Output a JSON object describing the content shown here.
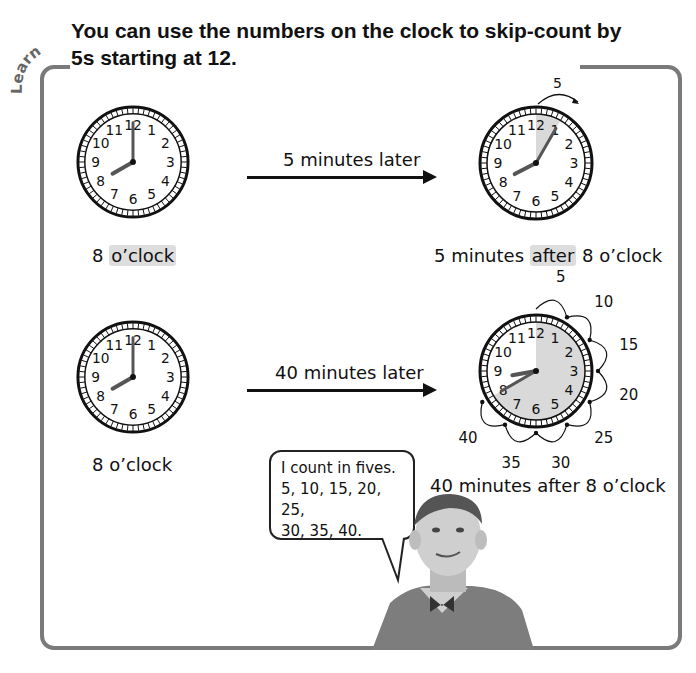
{
  "section_tag": "Learn",
  "title": "You can use the numbers on the clock to skip-count by 5s starting at 12.",
  "rows": [
    {
      "start_clock": {
        "hour": 8,
        "minute": 0,
        "caption_number": "8",
        "caption_word": "o’clock",
        "highlight": "o’clock"
      },
      "arrow_label": "5 minutes later",
      "end_clock": {
        "hour": 8,
        "minute": 5,
        "caption_pre": "5 minutes ",
        "caption_hl": "after",
        "caption_post": " 8 o’clock",
        "skip_labels": [
          "5"
        ]
      }
    },
    {
      "start_clock": {
        "hour": 8,
        "minute": 0,
        "caption": "8 o’clock"
      },
      "arrow_label": "40 minutes later",
      "end_clock": {
        "hour": 8,
        "minute": 40,
        "caption": "40 minutes after 8 o’clock",
        "skip_labels": [
          "5",
          "10",
          "15",
          "20",
          "25",
          "30",
          "35",
          "40"
        ]
      }
    }
  ],
  "clock_numbers": [
    "12",
    "1",
    "2",
    "3",
    "4",
    "5",
    "6",
    "7",
    "8",
    "9",
    "10",
    "11"
  ],
  "speech_bubble": {
    "line1": "I count in fives.",
    "line2": "5, 10, 15, 20, 25,",
    "line3": "30, 35, 40."
  },
  "colors": {
    "frame": "#7a7a7a",
    "highlight": "#dddddd",
    "shade": "#d9d9d9",
    "ink": "#111111"
  }
}
